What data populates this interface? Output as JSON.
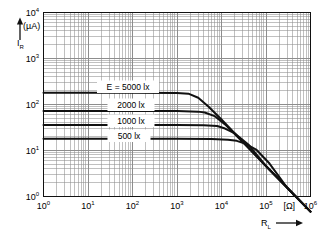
{
  "figure": {
    "name": "photocurrent-vs-load-resistance",
    "background": "#ffffff",
    "ink": "#111111",
    "grid_color": "#8d8d8d"
  },
  "yaxis": {
    "label": "I",
    "label_sub": "R",
    "unit": "(µA)",
    "arrow": "up",
    "ticks": [
      {
        "mant": "10",
        "exp": "0",
        "value": 1
      },
      {
        "mant": "10",
        "exp": "1",
        "value": 10
      },
      {
        "mant": "10",
        "exp": "2",
        "value": 100
      },
      {
        "mant": "10",
        "exp": "3",
        "value": 1000
      },
      {
        "mant": "10",
        "exp": "4",
        "value": 10000
      }
    ]
  },
  "xaxis": {
    "label": "R",
    "label_sub": "L",
    "unit": "[Ω]",
    "arrow": "right",
    "ticks": [
      {
        "mant": "10",
        "exp": "0",
        "value": 1
      },
      {
        "mant": "10",
        "exp": "1",
        "value": 10
      },
      {
        "mant": "10",
        "exp": "2",
        "value": 100
      },
      {
        "mant": "10",
        "exp": "3",
        "value": 1000
      },
      {
        "mant": "10",
        "exp": "4",
        "value": 10000
      },
      {
        "mant": "10",
        "exp": "5",
        "value": 100000
      },
      {
        "mant": "10",
        "exp": "6",
        "value": 1000000
      }
    ]
  },
  "curve_labels": {
    "c0": "E = 5000 lx",
    "c1": "2000 lx",
    "c2": "1000 lx",
    "c3": "500 lx"
  },
  "chart_data": {
    "type": "line",
    "title": "",
    "subtitle": "",
    "xlabel": "R_L [Ω]",
    "ylabel": "I_R (µA)",
    "xscale": "log",
    "yscale": "log",
    "xlim": [
      1,
      1000000
    ],
    "ylim": [
      1,
      10000
    ],
    "grid": true,
    "grid_minor": true,
    "legend": "inline-labels",
    "legend_position": "inside-left",
    "series": [
      {
        "name": "E = 5000 lx",
        "illuminance_lx": 5000,
        "plateau_uA": 180,
        "knee_ohm": 1800,
        "x": [
          1,
          10,
          100,
          1000,
          1800,
          3000,
          5000,
          10000,
          30000,
          100000,
          300000,
          1000000
        ],
        "y": [
          180,
          180,
          180,
          178,
          172,
          140,
          92,
          47,
          15.5,
          4.6,
          1.55,
          0.47
        ]
      },
      {
        "name": "2000 lx",
        "illuminance_lx": 2000,
        "plateau_uA": 72,
        "knee_ohm": 4200,
        "x": [
          1,
          10,
          100,
          1000,
          3000,
          4200,
          7000,
          12000,
          30000,
          100000,
          300000,
          1000000
        ],
        "y": [
          72,
          72,
          72,
          72,
          70,
          67,
          56,
          37,
          15.2,
          4.6,
          1.55,
          0.47
        ]
      },
      {
        "name": "1000 lx",
        "illuminance_lx": 1000,
        "plateau_uA": 36,
        "knee_ohm": 8000,
        "x": [
          1,
          10,
          100,
          1000,
          4000,
          8000,
          12000,
          20000,
          40000,
          100000,
          300000,
          1000000
        ],
        "y": [
          36,
          36,
          36,
          36,
          35.5,
          34,
          30,
          23.5,
          13.5,
          4.55,
          1.55,
          0.47
        ]
      },
      {
        "name": "500 lx",
        "illuminance_lx": 500,
        "plateau_uA": 18,
        "knee_ohm": 16000,
        "x": [
          1,
          10,
          100,
          1000,
          6000,
          14000,
          22000,
          35000,
          60000,
          120000,
          300000,
          1000000
        ],
        "y": [
          18,
          18,
          18,
          18,
          17.8,
          17.2,
          16.2,
          14,
          10.5,
          5.2,
          1.55,
          0.47
        ]
      }
    ]
  }
}
